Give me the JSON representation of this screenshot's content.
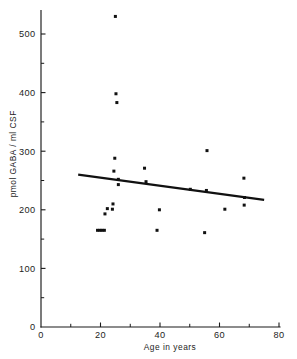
{
  "chart_data": {
    "type": "scatter",
    "title": "",
    "xlabel": "Age  in  years",
    "ylabel": "pmol  GABA / ml  CSF",
    "xlim": [
      0,
      80
    ],
    "ylim": [
      0,
      540
    ],
    "grid": false,
    "legend": null,
    "x_ticks_major": [
      0,
      20,
      40,
      60,
      80
    ],
    "x_tick_labels": [
      "0",
      "20",
      "40",
      "60",
      "80"
    ],
    "x_ticks_minor": [
      10,
      30,
      50,
      70
    ],
    "y_ticks_major": [
      0,
      100,
      200,
      300,
      400,
      500
    ],
    "y_tick_labels": [
      "0",
      "100",
      "200",
      "300",
      "400",
      "500"
    ],
    "y_ticks_minor": [
      50,
      150,
      250,
      350,
      450
    ],
    "marker": "square",
    "marker_color": "#111111",
    "points": [
      {
        "x": 19.0,
        "y": 165
      },
      {
        "x": 19.8,
        "y": 165
      },
      {
        "x": 20.5,
        "y": 165
      },
      {
        "x": 21.3,
        "y": 165
      },
      {
        "x": 21.5,
        "y": 193
      },
      {
        "x": 22.3,
        "y": 202
      },
      {
        "x": 24.0,
        "y": 201
      },
      {
        "x": 24.2,
        "y": 210
      },
      {
        "x": 24.8,
        "y": 288
      },
      {
        "x": 24.5,
        "y": 266
      },
      {
        "x": 25.0,
        "y": 530
      },
      {
        "x": 25.2,
        "y": 398
      },
      {
        "x": 25.5,
        "y": 383
      },
      {
        "x": 26.0,
        "y": 252
      },
      {
        "x": 26.0,
        "y": 243
      },
      {
        "x": 34.8,
        "y": 271
      },
      {
        "x": 35.3,
        "y": 248
      },
      {
        "x": 39.8,
        "y": 200
      },
      {
        "x": 39.0,
        "y": 165
      },
      {
        "x": 50.2,
        "y": 235
      },
      {
        "x": 55.8,
        "y": 301
      },
      {
        "x": 55.6,
        "y": 233
      },
      {
        "x": 55.0,
        "y": 161
      },
      {
        "x": 61.8,
        "y": 201
      },
      {
        "x": 68.2,
        "y": 254
      },
      {
        "x": 68.4,
        "y": 221
      },
      {
        "x": 68.3,
        "y": 208
      }
    ],
    "fit_line": {
      "label": "regression line",
      "x_start": 12.5,
      "y_start": 260,
      "x_end": 75.0,
      "y_end": 217
    },
    "annotations": []
  }
}
